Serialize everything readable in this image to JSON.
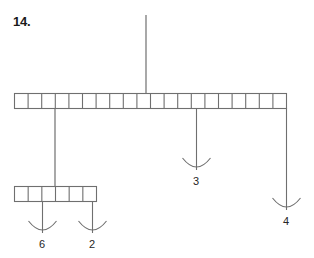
{
  "figure": {
    "problem_number": "14.",
    "stroke_color": "#6f6f6f",
    "label_color": "#262626",
    "background": "#ffffff"
  },
  "chart_data": {
    "type": "diagram",
    "title": "14.",
    "bars": [
      {
        "name": "top-bar",
        "cells": 20,
        "x": 14,
        "y": 93,
        "width": 272,
        "height": 15
      },
      {
        "name": "bottom-bar",
        "cells": 6,
        "x": 14,
        "y": 186,
        "width": 82,
        "height": 15
      }
    ],
    "stem": {
      "name": "top-stem",
      "x": 146,
      "y_top": 15,
      "y_bottom": 93
    },
    "connector": {
      "name": "bar-connector",
      "x": 55,
      "y_top": 108,
      "y_bottom": 186
    },
    "arrows": [
      {
        "label": "6",
        "x": 42,
        "y_top": 201,
        "y_tip": 233,
        "label_y": 238
      },
      {
        "label": "2",
        "x": 92,
        "y_top": 201,
        "y_tip": 233,
        "label_y": 238
      },
      {
        "label": "3",
        "x": 196,
        "y_top": 108,
        "y_tip": 170,
        "label_y": 175
      },
      {
        "label": "4",
        "x": 286,
        "y_top": 108,
        "y_tip": 210,
        "label_y": 215
      }
    ],
    "labels": [
      "6",
      "2",
      "3",
      "4"
    ]
  }
}
